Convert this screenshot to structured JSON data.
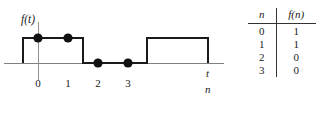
{
  "figure": {
    "graph": {
      "y_axis_label": "f(t)",
      "x_axis_label_top": "t",
      "x_axis_label_bottom": "n",
      "tick_labels": [
        "0",
        "1",
        "2",
        "3"
      ],
      "sample_points": [
        {
          "n": 0,
          "value": 1
        },
        {
          "n": 1,
          "value": 1
        },
        {
          "n": 2,
          "value": 0
        },
        {
          "n": 3,
          "value": 0
        }
      ],
      "waveform_description": "rectangular pulse high from before n=0 through n=1, low through n=3, high again after",
      "line_color": "#1a1a1a",
      "axis_color": "#777777",
      "dot_color": "#111111"
    },
    "table": {
      "headers": [
        "n",
        "f(n)"
      ],
      "rows": [
        [
          "0",
          "1"
        ],
        [
          "1",
          "1"
        ],
        [
          "2",
          "0"
        ],
        [
          "3",
          "0"
        ]
      ]
    }
  }
}
